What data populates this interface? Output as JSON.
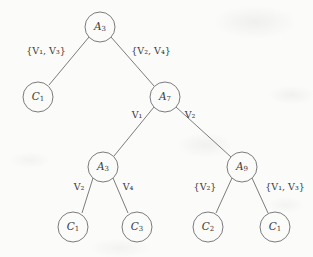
{
  "diagram": {
    "type": "decision-tree",
    "title": "",
    "background_color": "#fbfbf9",
    "stroke_color": "#6d6d70",
    "text_color": "#3a3a3c",
    "nodes": [
      {
        "id": "root",
        "label_var": "A",
        "label_sub": "3",
        "kind": "decision",
        "cx": 100,
        "cy": 27,
        "r": 15
      },
      {
        "id": "leaf-c1-a",
        "label_var": "C",
        "label_sub": "1",
        "kind": "class",
        "cx": 38,
        "cy": 97,
        "r": 15
      },
      {
        "id": "a7",
        "label_var": "A",
        "label_sub": "7",
        "kind": "decision",
        "cx": 165,
        "cy": 97,
        "r": 15
      },
      {
        "id": "a3-mid",
        "label_var": "A",
        "label_sub": "3",
        "kind": "decision",
        "cx": 103,
        "cy": 167,
        "r": 15
      },
      {
        "id": "a9",
        "label_var": "A",
        "label_sub": "9",
        "kind": "decision",
        "cx": 242,
        "cy": 167,
        "r": 15
      },
      {
        "id": "leaf-c1-b",
        "label_var": "C",
        "label_sub": "1",
        "kind": "class",
        "cx": 73,
        "cy": 227,
        "r": 15
      },
      {
        "id": "leaf-c3",
        "label_var": "C",
        "label_sub": "3",
        "kind": "class",
        "cx": 137,
        "cy": 227,
        "r": 15
      },
      {
        "id": "leaf-c2",
        "label_var": "C",
        "label_sub": "2",
        "kind": "class",
        "cx": 208,
        "cy": 227,
        "r": 15
      },
      {
        "id": "leaf-c1-c",
        "label_var": "C",
        "label_sub": "1",
        "kind": "class",
        "cx": 275,
        "cy": 227,
        "r": 15
      }
    ],
    "edges": [
      {
        "id": "e-root-left",
        "from": "root",
        "to": "leaf-c1-a",
        "label": "{V₁, V₃}",
        "label_x": 46,
        "label_y": 51
      },
      {
        "id": "e-root-right",
        "from": "root",
        "to": "a7",
        "label": "{V₂, V₄}",
        "label_x": 151,
        "label_y": 51
      },
      {
        "id": "e-a7-left",
        "from": "a7",
        "to": "a3-mid",
        "label": "V₁",
        "label_x": 137,
        "label_y": 115
      },
      {
        "id": "e-a7-right",
        "from": "a7",
        "to": "a9",
        "label": "V₂",
        "label_x": 190,
        "label_y": 115
      },
      {
        "id": "e-a3-left",
        "from": "a3-mid",
        "to": "leaf-c1-b",
        "label": "V₂",
        "label_x": 79,
        "label_y": 187
      },
      {
        "id": "e-a3-right",
        "from": "a3-mid",
        "to": "leaf-c3",
        "label": "V₄",
        "label_x": 128,
        "label_y": 187
      },
      {
        "id": "e-a9-left",
        "from": "a9",
        "to": "leaf-c2",
        "label": "{V₂}",
        "label_x": 205,
        "label_y": 187
      },
      {
        "id": "e-a9-right",
        "from": "a9",
        "to": "leaf-c1-c",
        "label": "{V₁, V₃}",
        "label_x": 285,
        "label_y": 187
      }
    ]
  }
}
